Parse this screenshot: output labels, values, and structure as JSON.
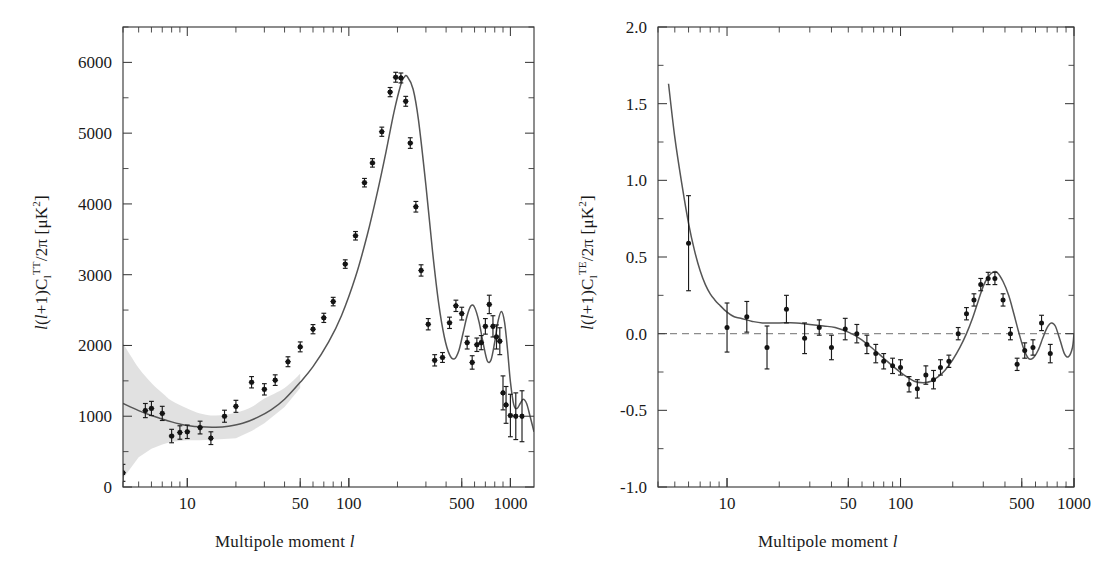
{
  "figure": {
    "background": "#ffffff",
    "ink_color": "#1a1a1a",
    "curve_color": "#555555",
    "band_color": "#c9c9c9",
    "point_color": "#141414"
  },
  "panels": [
    {
      "id": "tt",
      "xlabel_prefix": "Multipole moment ",
      "xlabel_symbol": "l",
      "ylabel_parts": {
        "lead": "l",
        "open": "(",
        "l2": "l",
        "plus": "+1)C",
        "sub": "l",
        "sup": "TT",
        "tail": "/2π [μK",
        "sup2": "2",
        "close": "]"
      },
      "ylabel_plain": "l(l+1)C_l^TT/2π [μK^2]",
      "xticklabels": [
        "10",
        "50",
        "100",
        "500",
        "1000"
      ],
      "yticklabels": [
        "0",
        "1000",
        "2000",
        "3000",
        "4000",
        "5000",
        "6000"
      ]
    },
    {
      "id": "te",
      "xlabel_prefix": "Multipole moment ",
      "xlabel_symbol": "l",
      "ylabel_parts": {
        "lead": "l",
        "open": "(",
        "l2": "l",
        "plus": "+1)C",
        "sub": "l",
        "sup": "TE",
        "tail": "/2π [μK",
        "sup2": "2",
        "close": "]"
      },
      "ylabel_plain": "l(l+1)C_l^TE/2π [μK^2]",
      "xticklabels": [
        "10",
        "50",
        "100",
        "500",
        "1000"
      ],
      "yticklabels": [
        "-1.0",
        "-0.5",
        "0.0",
        "0.5",
        "1.0",
        "1.5",
        "2.0"
      ]
    }
  ],
  "chart_data": [
    {
      "type": "scatter",
      "id": "tt-spectrum",
      "title": "",
      "xlabel": "Multipole moment l",
      "ylabel": "l(l+1)C_l^TT/2π [μK^2]",
      "xscale": "log",
      "yscale": "linear",
      "xlim": [
        4,
        1400
      ],
      "ylim": [
        0,
        6500
      ],
      "xticks": [
        10,
        50,
        100,
        500,
        1000
      ],
      "yticks": [
        0,
        1000,
        2000,
        3000,
        4000,
        5000,
        6000
      ],
      "grid": false,
      "legend": "none",
      "series": [
        {
          "name": "WMAP TT data",
          "marker": "filled-diamond",
          "x": [
            4,
            5.5,
            6,
            7,
            8,
            9,
            10,
            12,
            14,
            17,
            20,
            25,
            30,
            35,
            42,
            50,
            60,
            70,
            80,
            95,
            110,
            125,
            140,
            160,
            180,
            195,
            210,
            225,
            240,
            260,
            280,
            310,
            340,
            380,
            420,
            460,
            500,
            540,
            580,
            620,
            660,
            700,
            740,
            780,
            820,
            860,
            900,
            940,
            1000,
            1080,
            1180
          ],
          "y": [
            200,
            1080,
            1110,
            1040,
            720,
            770,
            780,
            840,
            690,
            1000,
            1140,
            1480,
            1380,
            1510,
            1770,
            1980,
            2230,
            2390,
            2620,
            3150,
            3550,
            4300,
            4580,
            5020,
            5580,
            5790,
            5780,
            5450,
            4860,
            3960,
            3060,
            2300,
            1790,
            1830,
            2320,
            2560,
            2450,
            2040,
            1760,
            2010,
            2040,
            2270,
            2580,
            2270,
            2120,
            2060,
            1330,
            1160,
            1010,
            1000,
            1000
          ],
          "yerr": [
            120,
            100,
            100,
            100,
            95,
            95,
            95,
            90,
            90,
            85,
            85,
            80,
            80,
            75,
            70,
            70,
            65,
            65,
            60,
            60,
            60,
            60,
            60,
            65,
            65,
            70,
            70,
            70,
            75,
            75,
            80,
            80,
            80,
            70,
            80,
            80,
            90,
            90,
            95,
            95,
            100,
            110,
            130,
            150,
            170,
            190,
            240,
            260,
            300,
            330,
            360
          ]
        },
        {
          "name": "Best-fit LCDM model",
          "marker": "line",
          "x": [
            4,
            5,
            6,
            7,
            8,
            9,
            10,
            12,
            15,
            18,
            22,
            27,
            33,
            40,
            50,
            60,
            75,
            90,
            110,
            130,
            150,
            170,
            190,
            210,
            220,
            230,
            250,
            270,
            300,
            330,
            360,
            390,
            420,
            450,
            480,
            510,
            540,
            570,
            600,
            640,
            680,
            720,
            760,
            800,
            840,
            880,
            920,
            960,
            1000,
            1050,
            1100,
            1150,
            1200,
            1260,
            1320,
            1400
          ],
          "y": [
            1180,
            1080,
            1010,
            960,
            920,
            890,
            870,
            850,
            845,
            860,
            900,
            980,
            1090,
            1240,
            1480,
            1700,
            2050,
            2420,
            2970,
            3560,
            4160,
            4740,
            5290,
            5690,
            5790,
            5800,
            5620,
            5180,
            4260,
            3320,
            2590,
            2120,
            1870,
            1810,
            1930,
            2180,
            2420,
            2560,
            2540,
            2330,
            2020,
            1780,
            1800,
            2050,
            2350,
            2480,
            2330,
            1940,
            1490,
            1160,
            1110,
            1180,
            1240,
            1180,
            1010,
            780
          ]
        }
      ],
      "bands": [
        {
          "name": "cosmic variance",
          "x": [
            4,
            5,
            6,
            7,
            8,
            10,
            12,
            15,
            20,
            25,
            30,
            40,
            50
          ],
          "ylow": [
            120,
            420,
            540,
            600,
            640,
            660,
            660,
            670,
            690,
            790,
            900,
            1130,
            1400
          ],
          "yhigh": [
            2030,
            1680,
            1470,
            1330,
            1220,
            1110,
            1040,
            1010,
            1050,
            1130,
            1250,
            1400,
            1600
          ]
        }
      ]
    },
    {
      "type": "scatter",
      "id": "te-spectrum",
      "title": "",
      "xlabel": "Multipole moment l",
      "ylabel": "l(l+1)C_l^TE/2π [μK^2]",
      "xscale": "log",
      "yscale": "linear",
      "xlim": [
        4,
        1000
      ],
      "ylim": [
        -1.0,
        2.0
      ],
      "xticks": [
        10,
        50,
        100,
        500,
        1000
      ],
      "yticks": [
        -1.0,
        -0.5,
        0.0,
        0.5,
        1.0,
        1.5,
        2.0
      ],
      "grid": false,
      "legend": "none",
      "zero_reference_line": 0.0,
      "series": [
        {
          "name": "WMAP TE data",
          "marker": "filled-circle",
          "x": [
            6,
            10,
            13,
            17,
            22,
            28,
            34,
            40,
            48,
            56,
            64,
            72,
            80,
            90,
            100,
            112,
            125,
            140,
            155,
            170,
            190,
            215,
            240,
            265,
            290,
            320,
            350,
            390,
            430,
            470,
            520,
            580,
            650,
            730
          ],
          "y": [
            0.59,
            0.04,
            0.11,
            -0.09,
            0.16,
            -0.03,
            0.04,
            -0.09,
            0.03,
            0.0,
            -0.07,
            -0.13,
            -0.18,
            -0.21,
            -0.22,
            -0.33,
            -0.36,
            -0.27,
            -0.3,
            -0.22,
            -0.18,
            0.0,
            0.13,
            0.22,
            0.32,
            0.36,
            0.36,
            0.22,
            0.0,
            -0.2,
            -0.11,
            -0.09,
            0.07,
            -0.13,
            -0.16
          ],
          "yerr": [
            0.31,
            0.16,
            0.1,
            0.14,
            0.09,
            0.1,
            0.05,
            0.08,
            0.07,
            0.06,
            0.06,
            0.06,
            0.05,
            0.05,
            0.05,
            0.05,
            0.06,
            0.06,
            0.06,
            0.05,
            0.04,
            0.04,
            0.04,
            0.04,
            0.04,
            0.04,
            0.04,
            0.04,
            0.04,
            0.04,
            0.05,
            0.05,
            0.05,
            0.06,
            0.06
          ]
        },
        {
          "name": "Best-fit LCDM model",
          "marker": "line",
          "x": [
            4.6,
            5,
            5.5,
            6,
            6.5,
            7,
            7.5,
            8,
            8.5,
            9,
            10,
            11,
            12,
            14,
            16,
            20,
            25,
            30,
            36,
            42,
            50,
            58,
            68,
            80,
            92,
            105,
            120,
            135,
            150,
            165,
            180,
            200,
            220,
            240,
            260,
            280,
            300,
            320,
            340,
            360,
            390,
            420,
            450,
            480,
            510,
            545,
            580,
            620,
            660,
            700,
            740,
            780,
            830,
            880,
            930,
            980,
            1000
          ],
          "y": [
            1.63,
            1.28,
            0.97,
            0.72,
            0.54,
            0.41,
            0.32,
            0.26,
            0.22,
            0.19,
            0.14,
            0.11,
            0.1,
            0.08,
            0.07,
            0.07,
            0.07,
            0.06,
            0.05,
            0.04,
            0.01,
            -0.03,
            -0.09,
            -0.16,
            -0.22,
            -0.27,
            -0.31,
            -0.32,
            -0.31,
            -0.28,
            -0.24,
            -0.17,
            -0.09,
            0.0,
            0.1,
            0.21,
            0.31,
            0.37,
            0.4,
            0.4,
            0.34,
            0.25,
            0.13,
            0.01,
            -0.09,
            -0.16,
            -0.16,
            -0.11,
            -0.03,
            0.04,
            0.07,
            0.05,
            -0.04,
            -0.13,
            -0.15,
            -0.09,
            0.0
          ]
        }
      ]
    }
  ]
}
